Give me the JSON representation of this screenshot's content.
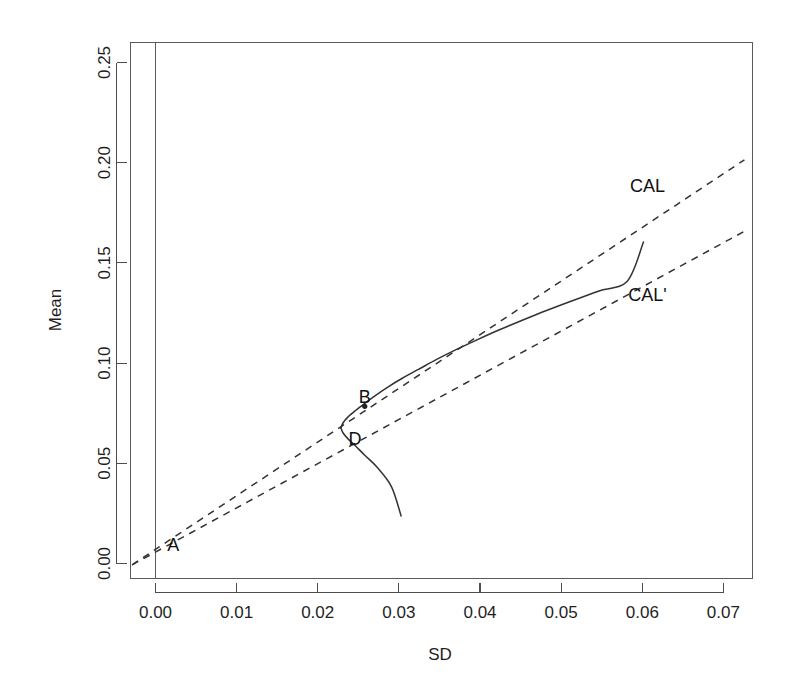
{
  "chart_data": {
    "type": "line",
    "title": "",
    "xlabel": "SD",
    "ylabel": "Mean",
    "xlim": [
      -0.0035,
      0.0735
    ],
    "ylim": [
      -0.012,
      0.262
    ],
    "grid": false,
    "legend_position": "inline-annotations",
    "xticks": [
      "0.00",
      "0.01",
      "0.02",
      "0.03",
      "0.04",
      "0.05",
      "0.06",
      "0.07"
    ],
    "xtick_values": [
      0.0,
      0.01,
      0.02,
      0.03,
      0.04,
      0.05,
      0.06,
      0.07
    ],
    "yticks": [
      "0.00",
      "0.05",
      "0.10",
      "0.15",
      "0.20",
      "0.25"
    ],
    "ytick_values": [
      0.0,
      0.05,
      0.1,
      0.15,
      0.2,
      0.25
    ],
    "series": [
      {
        "name": "efficient-frontier-upper",
        "style": "solid",
        "x": [
          0.02255,
          0.0228,
          0.0234,
          0.0244,
          0.0255,
          0.0268,
          0.0284,
          0.0302,
          0.0322,
          0.0344,
          0.0368,
          0.0394,
          0.0421,
          0.045,
          0.048,
          0.0512,
          0.0545,
          0.058,
          0.06
        ],
        "y": [
          0.065,
          0.0675,
          0.0705,
          0.074,
          0.0775,
          0.0815,
          0.086,
          0.0905,
          0.095,
          0.1,
          0.105,
          0.11,
          0.115,
          0.12,
          0.125,
          0.13,
          0.135,
          0.14,
          0.16
        ]
      },
      {
        "name": "efficient-frontier-lower",
        "style": "solid",
        "x": [
          0.02255,
          0.0228,
          0.0234,
          0.0243,
          0.0255,
          0.027,
          0.0288,
          0.03
        ],
        "y": [
          0.065,
          0.0625,
          0.0595,
          0.056,
          0.051,
          0.045,
          0.035,
          0.02
        ]
      },
      {
        "name": "CAL",
        "style": "dashed",
        "x": [
          -0.0033,
          0.0725
        ],
        "y": [
          -0.005,
          0.202
        ],
        "intercept": 0.0,
        "slope": 2.72,
        "tangency_point": "B"
      },
      {
        "name": "CAL'",
        "style": "dashed",
        "x": [
          -0.0033,
          0.0725
        ],
        "y": [
          -0.005,
          0.1655
        ],
        "intercept": 0.0005,
        "slope": 2.21,
        "crossing_point": "D"
      }
    ],
    "annotations": [
      {
        "label": "A",
        "x": 0.0018,
        "y": 0.002,
        "note": "risk-free asset / lines origin"
      },
      {
        "label": "B",
        "x": 0.0255,
        "y": 0.0775,
        "note": "tangency portfolio on CAL"
      },
      {
        "label": "D",
        "x": 0.0243,
        "y": 0.056,
        "note": "portfolio on CAL' lower branch"
      },
      {
        "label": "CAL",
        "x": 0.0605,
        "y": 0.1855,
        "note": "capital allocation line label"
      },
      {
        "label": "CAL'",
        "x": 0.0605,
        "y": 0.13,
        "note": "second capital allocation line label"
      }
    ],
    "markers": [
      {
        "label": "B",
        "x": 0.0255,
        "y": 0.076
      }
    ],
    "reference_lines": [
      {
        "name": "sd-zero-vertical",
        "orientation": "vertical",
        "value": 0.0
      }
    ]
  }
}
